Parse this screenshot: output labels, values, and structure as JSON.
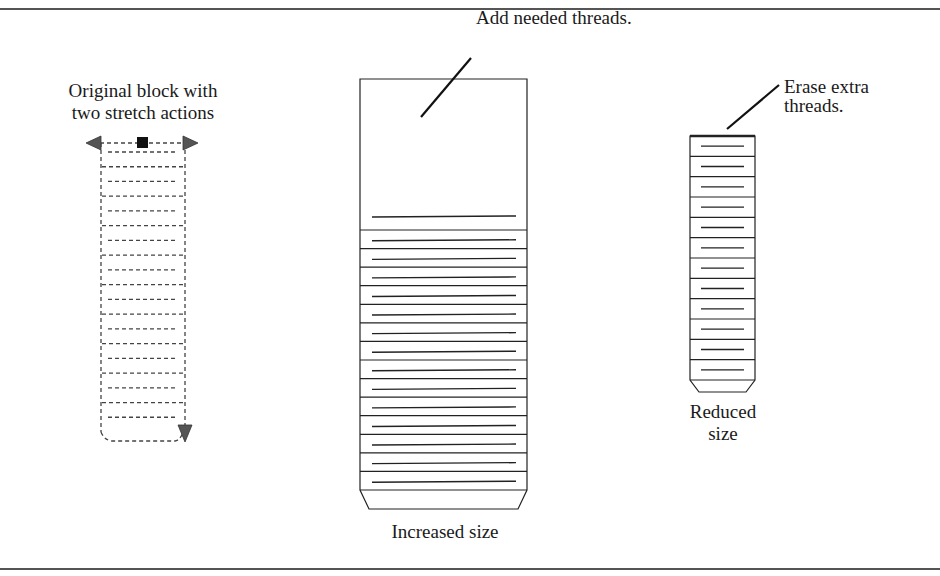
{
  "figure": {
    "original": {
      "caption_line1": "Original block with",
      "caption_line2": "two stretch actions",
      "style": "dashed",
      "dashed_rows": 19
    },
    "increased": {
      "annotation": "Add needed threads.",
      "caption": "Increased size",
      "thread_bands": 14,
      "stroke": "#222222"
    },
    "reduced": {
      "annotation_line1": "Erase extra",
      "annotation_line2": "threads.",
      "caption_line1": "Reduced",
      "caption_line2": "size",
      "thread_bands": 12,
      "stroke": "#222222"
    },
    "colors": {
      "frame": "#555555",
      "grip": "#111111",
      "arrow": "#555555"
    }
  }
}
